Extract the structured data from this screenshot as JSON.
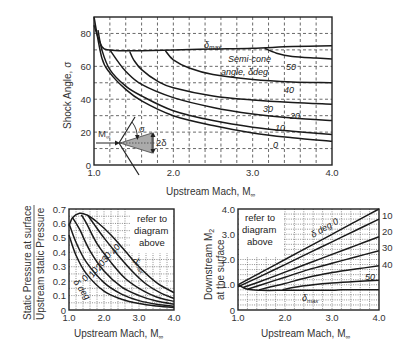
{
  "chart_data": [
    {
      "type": "line",
      "title": "Conical shock angle vs upstream Mach",
      "xlabel": "Upstream Mach, M∞",
      "ylabel": "Shock Angle, σ",
      "xlim": [
        1.0,
        4.0
      ],
      "ylim": [
        0,
        90
      ],
      "xticks": [
        "1.0",
        "2.0",
        "3.0",
        "4.0"
      ],
      "yticks": [
        "0",
        "20",
        "40",
        "60",
        "80"
      ],
      "grid": "dashed",
      "annotations": [
        "δmax",
        "Semi-cone angle, δdeg",
        "M∞",
        "σ",
        "2δ"
      ],
      "series": [
        {
          "name": "0",
          "x": [
            1.0,
            1.1,
            1.2,
            1.4,
            1.6,
            2.0,
            2.5,
            3.0,
            3.5,
            4.0
          ],
          "y": [
            90,
            65,
            56,
            46,
            39,
            30,
            24,
            19.5,
            16.6,
            14.5
          ]
        },
        {
          "name": "10",
          "x": [
            1.05,
            1.1,
            1.2,
            1.4,
            1.6,
            2.0,
            2.5,
            3.0,
            3.5,
            4.0
          ],
          "y": [
            82,
            70,
            58,
            48,
            42,
            33,
            27,
            23,
            20.5,
            18.5
          ]
        },
        {
          "name": "20",
          "x": [
            1.2,
            1.3,
            1.4,
            1.6,
            2.0,
            2.5,
            3.0,
            3.5,
            4.0
          ],
          "y": [
            70,
            63,
            57,
            49,
            41,
            35,
            31,
            28.5,
            27
          ]
        },
        {
          "name": "30",
          "x": [
            1.45,
            1.5,
            1.6,
            1.8,
            2.0,
            2.5,
            3.0,
            3.5,
            4.0
          ],
          "y": [
            69,
            64,
            58,
            51,
            47,
            42,
            39.5,
            38,
            37
          ]
        },
        {
          "name": "40",
          "x": [
            1.9,
            2.0,
            2.2,
            2.5,
            3.0,
            3.5,
            4.0
          ],
          "y": [
            69.5,
            64,
            59,
            55,
            52,
            50.5,
            50
          ]
        },
        {
          "name": "50",
          "x": [
            3.15,
            3.3,
            3.5,
            3.8,
            4.0
          ],
          "y": [
            71,
            68,
            66,
            65,
            64.5
          ]
        },
        {
          "name": "δmax",
          "x": [
            1.0,
            1.1,
            1.2,
            1.4,
            1.6,
            2.0,
            2.5,
            3.0,
            3.5,
            4.0
          ],
          "y": [
            85,
            72,
            70,
            69.5,
            69.5,
            70,
            70.5,
            71,
            72,
            72.5
          ]
        }
      ]
    },
    {
      "type": "line",
      "title": "Surface static pressure ratio",
      "xlabel": "Upstream Mach, M∞",
      "ylabel": "Static Pressure at surface / Upstream static Pressure",
      "xlim": [
        1.0,
        4.0
      ],
      "ylim": [
        0,
        0.7
      ],
      "xticks": [
        "1.0",
        "2.0",
        "3.0",
        "4.0"
      ],
      "yticks": [
        "0",
        "0.1",
        "0.2",
        "0.3",
        "0.4",
        "0.5",
        "0.6",
        "0.7"
      ],
      "grid": "dotted",
      "annotations": [
        "refer to diagram above",
        "δ deg",
        "0",
        "10",
        "20",
        "30",
        "40",
        "δmax"
      ],
      "series": [
        {
          "name": "0",
          "x": [
            1.0,
            1.2,
            1.5,
            2.0,
            2.5,
            3.0,
            3.5,
            4.0
          ],
          "y": [
            0.52,
            0.38,
            0.25,
            0.13,
            0.075,
            0.045,
            0.028,
            0.018
          ]
        },
        {
          "name": "10",
          "x": [
            1.0,
            1.2,
            1.5,
            2.0,
            2.5,
            3.0,
            3.5,
            4.0
          ],
          "y": [
            0.6,
            0.47,
            0.33,
            0.19,
            0.11,
            0.065,
            0.04,
            0.026
          ]
        },
        {
          "name": "20",
          "x": [
            1.1,
            1.3,
            1.6,
            2.0,
            2.5,
            3.0,
            3.5,
            4.0
          ],
          "y": [
            0.64,
            0.56,
            0.41,
            0.27,
            0.16,
            0.1,
            0.062,
            0.04
          ]
        },
        {
          "name": "30",
          "x": [
            1.35,
            1.5,
            1.8,
            2.2,
            2.6,
            3.0,
            3.5,
            4.0
          ],
          "y": [
            0.66,
            0.6,
            0.46,
            0.33,
            0.22,
            0.15,
            0.09,
            0.06
          ]
        },
        {
          "name": "40",
          "x": [
            1.55,
            1.7,
            2.0,
            2.4,
            2.8,
            3.2,
            3.6,
            4.0
          ],
          "y": [
            0.65,
            0.6,
            0.5,
            0.38,
            0.27,
            0.18,
            0.12,
            0.08
          ]
        },
        {
          "name": "δmax",
          "x": [
            1.0,
            1.1,
            1.3,
            1.5,
            1.8,
            2.2,
            2.6,
            3.0,
            3.5,
            4.0
          ],
          "y": [
            0.58,
            0.64,
            0.67,
            0.66,
            0.61,
            0.52,
            0.41,
            0.3,
            0.19,
            0.12
          ]
        }
      ]
    },
    {
      "type": "line",
      "title": "Downstream Mach at the surface",
      "xlabel": "Upstream Mach, M∞",
      "ylabel": "Downstream M2 at the surface",
      "xlim": [
        1.0,
        4.0
      ],
      "ylim": [
        0,
        4.0
      ],
      "xticks": [
        "1.0",
        "2.0",
        "3.0",
        "4.0"
      ],
      "yticks": [
        "0",
        "1.0",
        "2.0",
        "3.0",
        "4.0"
      ],
      "grid": "dotted",
      "annotations": [
        "refer to diagram above",
        "δ deg 0",
        "10",
        "20",
        "30",
        "40",
        "50",
        "δmax"
      ],
      "series": [
        {
          "name": "0",
          "x": [
            1.0,
            1.5,
            2.0,
            2.5,
            3.0,
            3.5,
            4.0
          ],
          "y": [
            1.0,
            1.5,
            2.0,
            2.5,
            3.0,
            3.5,
            4.0
          ]
        },
        {
          "name": "10",
          "x": [
            1.0,
            1.5,
            2.0,
            2.5,
            3.0,
            3.5,
            4.0
          ],
          "y": [
            0.92,
            1.35,
            1.8,
            2.25,
            2.7,
            3.15,
            3.6
          ]
        },
        {
          "name": "20",
          "x": [
            1.1,
            1.5,
            2.0,
            2.5,
            3.0,
            3.5,
            4.0
          ],
          "y": [
            0.88,
            1.15,
            1.5,
            1.85,
            2.2,
            2.55,
            2.9
          ]
        },
        {
          "name": "30",
          "x": [
            1.2,
            1.5,
            2.0,
            2.5,
            3.0,
            3.5,
            4.0
          ],
          "y": [
            0.82,
            1.0,
            1.3,
            1.6,
            1.85,
            2.1,
            2.35
          ]
        },
        {
          "name": "40",
          "x": [
            1.45,
            1.7,
            2.0,
            2.5,
            3.0,
            3.5,
            4.0
          ],
          "y": [
            0.8,
            0.92,
            1.05,
            1.3,
            1.48,
            1.62,
            1.75
          ]
        },
        {
          "name": "50",
          "x": [
            1.95,
            2.2,
            2.6,
            3.0,
            3.5,
            4.0
          ],
          "y": [
            0.8,
            0.9,
            1.0,
            1.07,
            1.13,
            1.18
          ]
        },
        {
          "name": "δmax",
          "x": [
            1.0,
            1.2,
            1.5,
            2.0,
            2.5,
            3.0,
            3.2,
            3.5,
            4.0
          ],
          "y": [
            1.0,
            0.82,
            0.78,
            0.78,
            0.78,
            0.78,
            0.8,
            0.8,
            0.8
          ]
        }
      ]
    }
  ],
  "labels": {
    "top_ylabel": "Shock Angle, σ",
    "top_xlabel": "Upstream Mach, M",
    "inf_sub": "∞",
    "bl_ylabel_1": "Static Pressure at surface",
    "bl_ylabel_2": "Upstream static Pressure",
    "br_ylabel_1": "Downstream M",
    "br_ylabel_sub": "2",
    "br_ylabel_2": "at the surface",
    "refer_1": "refer to",
    "refer_2": "diagram",
    "refer_3": "above",
    "delta_max": "δ",
    "max_sub": "max",
    "semi_cone_1": "Semi-cone",
    "semi_cone_2": "angle, δdeg",
    "sigma": "σ",
    "two_delta": "2δ",
    "m_inf": "M",
    "delta_deg": "δ deg",
    "delta_deg_0": "δ deg 0",
    "curve_labels_top": [
      "0",
      "10",
      "20",
      "30",
      "40",
      "50"
    ],
    "curve_labels_bl": [
      "0",
      "10",
      "20",
      "30",
      "40"
    ],
    "curve_labels_br": [
      "10",
      "20",
      "30",
      "40",
      "50"
    ]
  }
}
